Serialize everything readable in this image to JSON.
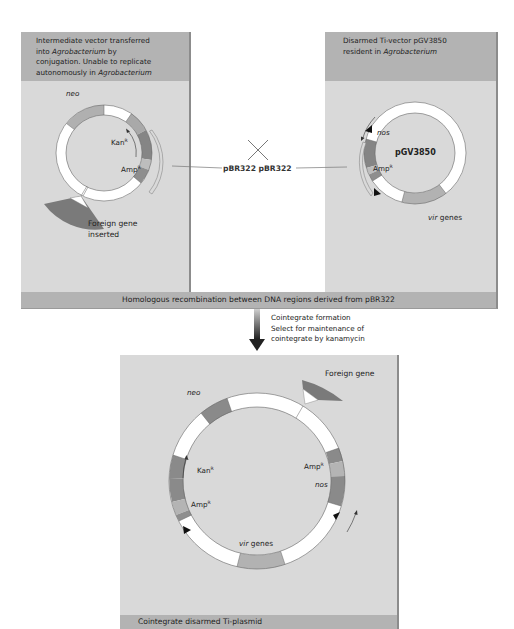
{
  "left_panel": {
    "header_lines": [
      "Intermediate vector transferred",
      "into ",
      "Agrobacterium",
      " by",
      "conjugation. Unable to replicate",
      "autonomously in ",
      "Agrobacterium"
    ],
    "header_text": "Intermediate vector transferred into Agrobacterium by conjugation. Unable to replicate autonomously in Agrobacterium",
    "labels": {
      "neo": "neo",
      "kan": "Kan",
      "kan_sup": "R",
      "amp": "Amp",
      "amp_sup": "R",
      "foreign_gene_1": "Foreign gene",
      "foreign_gene_2": "inserted"
    }
  },
  "right_panel": {
    "header_text": "Disarmed Ti-vector pGV3850 resident in Agrobacterium",
    "header_line1": "Disarmed Ti-vector pGV3850",
    "header_line2_a": "resident in ",
    "header_line2_b": "Agrobacterium",
    "labels": {
      "nos": "nos",
      "plasmid_name": "pGV3850",
      "amp": "Amp",
      "amp_sup": "R",
      "vir_italic": "vir",
      "vir_rest": " genes"
    }
  },
  "crossover": {
    "symbol": "×",
    "label": "pBR322 pBR322"
  },
  "recombination_banner": "Homologous recombination between DNA regions derived from pBR322",
  "process_arrow": {
    "lines": [
      "Cointegrate formation",
      "Select for maintenance of",
      "cointegrate by kanamycin"
    ]
  },
  "result_panel": {
    "labels": {
      "foreign_gene": "Foreign gene",
      "neo": "neo",
      "kan": "Kan",
      "kan_sup": "R",
      "amp_left": "Amp",
      "amp_left_sup": "R",
      "amp_right": "Amp",
      "amp_right_sup": "R",
      "nos": "nos",
      "vir_italic": "vir",
      "vir_rest": " genes"
    },
    "footer": "Cointegrate disarmed Ti-plasmid"
  },
  "colors": {
    "panel_bg": "#d9d9d9",
    "header_bg": "#b3b3b3",
    "dark_segment": "#8a8a8a",
    "mid_segment": "#a6a6a6",
    "light_segment": "#bdbdbd",
    "ring_white": "#ffffff",
    "arrow": "#333333"
  }
}
